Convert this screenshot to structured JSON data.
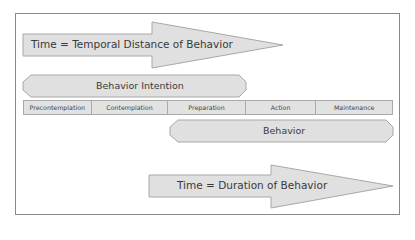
{
  "diagram": {
    "top_arrow": {
      "label": "Time = Temporal Distance of Behavior"
    },
    "intention_bar": {
      "label": "Behavior Intention"
    },
    "stages": [
      {
        "label": "Precontemplation"
      },
      {
        "label": "Contemplation"
      },
      {
        "label": "Preparation"
      },
      {
        "label": "Action"
      },
      {
        "label": "Maintenance"
      }
    ],
    "behavior_bar": {
      "label": "Behavior"
    },
    "bottom_arrow": {
      "label": "Time = Duration of Behavior"
    },
    "colors": {
      "fill": "#e0e0e0",
      "stroke": "#a8a8a8",
      "frame": "#8a8a8a"
    }
  }
}
